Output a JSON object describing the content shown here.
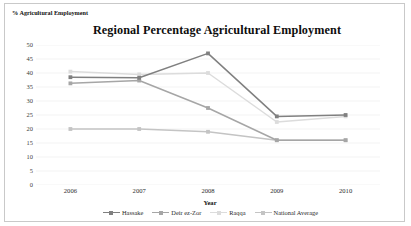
{
  "chart_data": {
    "type": "line",
    "title": "Regional Percentage Agricultural Employment",
    "xlabel": "Year",
    "ylabel": "% Agricultural Employment",
    "categories": [
      "2006",
      "2007",
      "2008",
      "2009",
      "2010"
    ],
    "x": [
      2006,
      2007,
      2008,
      2009,
      2010
    ],
    "ylim": [
      0,
      50
    ],
    "yticks": [
      "0",
      "5",
      "10",
      "15",
      "20",
      "25",
      "30",
      "35",
      "40",
      "45",
      "50"
    ],
    "ytick_values": [
      0,
      5,
      10,
      15,
      20,
      25,
      30,
      35,
      40,
      45,
      50
    ],
    "grid": true,
    "grid_axis": "y",
    "legend_position": "bottom",
    "marker": "square",
    "series": [
      {
        "name": "Hassake",
        "color": "#808080",
        "values": [
          38.5,
          38.3,
          47.0,
          24.5,
          25.0
        ]
      },
      {
        "name": "Deir ez-Zor",
        "color": "#a6a6a6",
        "values": [
          36.3,
          37.3,
          27.5,
          16.0,
          16.0
        ]
      },
      {
        "name": "Raqqa",
        "color": "#dcdcdc",
        "values": [
          40.5,
          39.5,
          40.0,
          22.5,
          24.5
        ]
      },
      {
        "name": "National Average",
        "color": "#c4c4c4",
        "values": [
          20.0,
          20.0,
          19.0,
          16.0,
          16.0
        ]
      }
    ]
  },
  "colors": {
    "border": "#c9c9c9",
    "gridline": "#eeeeee",
    "text": "#1a1a1a"
  }
}
